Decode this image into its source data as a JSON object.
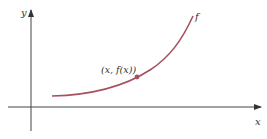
{
  "diagram": {
    "type": "function-graph",
    "axes": {
      "x_label": "x",
      "y_label": "y"
    },
    "curve": {
      "label": "f",
      "color": "#a8505f",
      "shape": "increasing exponential-like"
    },
    "point": {
      "label": "(x, f(x))",
      "color": "#a8505f"
    },
    "axis_color": "#333333"
  }
}
